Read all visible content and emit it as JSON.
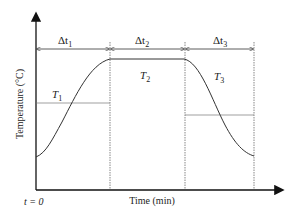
{
  "diagram": {
    "y_axis_label": "Temperature (°C)",
    "x_axis_label": "Time (min)",
    "origin_label": "t = 0",
    "intervals": [
      {
        "delta": "Δt",
        "sub": "1",
        "temp": "T",
        "temp_sub": "1"
      },
      {
        "delta": "Δt",
        "sub": "2",
        "temp": "T",
        "temp_sub": "2"
      },
      {
        "delta": "Δt",
        "sub": "3",
        "temp": "T",
        "temp_sub": "3"
      }
    ],
    "colors": {
      "line": "#333333",
      "axis": "#111111",
      "divider": "#555555"
    }
  }
}
